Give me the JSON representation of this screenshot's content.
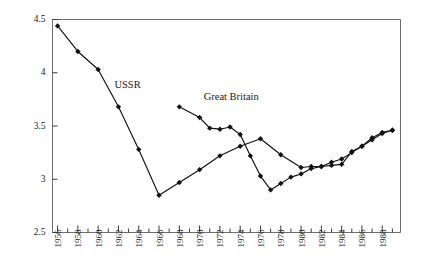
{
  "chart_data": {
    "type": "line",
    "title": "",
    "subtitle": "",
    "xlabel": "",
    "ylabel": "",
    "xlim": [
      1955.5,
      1989.8
    ],
    "ylim": [
      2.5,
      4.5
    ],
    "grid": false,
    "legend_position": "inline-annotation",
    "y_ticks": [
      2.5,
      3,
      3.5,
      4,
      4.5
    ],
    "y_tick_labels": [
      "2.5",
      "3",
      "3.5",
      "4",
      "4.5"
    ],
    "x_ticks": [
      1956,
      1957,
      1958,
      1959,
      1960,
      1961,
      1962,
      1963,
      1964,
      1965,
      1966,
      1967,
      1968,
      1969,
      1970,
      1971,
      1972,
      1973,
      1974,
      1975,
      1976,
      1977,
      1978,
      1979,
      1980,
      1981,
      1982,
      1983,
      1984,
      1985,
      1986,
      1987,
      1988,
      1989
    ],
    "x_tick_labels": [
      "1956",
      "1958",
      "1960",
      "1962",
      "1964",
      "1966",
      "1968",
      "1970",
      "1972",
      "1974",
      "1976",
      "1978",
      "1980",
      "1982",
      "1984",
      "1986",
      "1988"
    ],
    "x_tick_label_values": [
      1956,
      1958,
      1960,
      1962,
      1964,
      1966,
      1968,
      1970,
      1972,
      1974,
      1976,
      1978,
      1980,
      1982,
      1984,
      1986,
      1988
    ],
    "series": [
      {
        "name": "USSR",
        "label_x": 1961.6,
        "label_y": 3.86,
        "x": [
          1956,
          1958,
          1960,
          1962,
          1964,
          1966,
          1968,
          1970,
          1972,
          1974,
          1976,
          1978,
          1980,
          1981,
          1982,
          1983,
          1984,
          1985,
          1986,
          1987,
          1988,
          1989
        ],
        "values": [
          4.44,
          4.2,
          4.03,
          3.68,
          3.28,
          2.85,
          2.97,
          3.09,
          3.22,
          3.31,
          3.38,
          3.23,
          3.11,
          3.12,
          3.12,
          3.16,
          3.19,
          3.25,
          3.31,
          3.39,
          3.44,
          3.46
        ]
      },
      {
        "name": "Great Britain",
        "label_x": 1970.4,
        "label_y": 3.74,
        "x": [
          1968,
          1970,
          1971,
          1972,
          1973,
          1974,
          1975,
          1976,
          1977,
          1978,
          1979,
          1980,
          1981,
          1982,
          1983,
          1984,
          1985,
          1986,
          1987,
          1988,
          1989
        ],
        "values": [
          3.68,
          3.58,
          3.48,
          3.47,
          3.49,
          3.42,
          3.22,
          3.03,
          2.9,
          2.96,
          3.02,
          3.05,
          3.1,
          3.12,
          3.13,
          3.14,
          3.26,
          3.31,
          3.37,
          3.43,
          3.46
        ]
      }
    ],
    "colors": {
      "line": "#111111",
      "marker": "#111111",
      "axis": "#6f6f6f",
      "background": "#ffffff",
      "text": "#1a1a1a"
    }
  }
}
